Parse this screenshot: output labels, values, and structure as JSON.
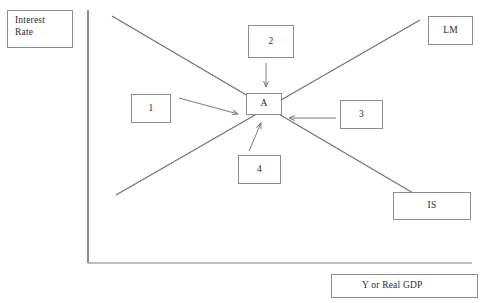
{
  "figure": {
    "type": "is-lm-diagram",
    "background_color": "#ffffff",
    "line_color": "#6e6e6e",
    "box_border_color": "#8c8c8c",
    "text_color": "#2b2b2b"
  },
  "axes": {
    "y_axis": {
      "label": "Interest\nRate",
      "label_line_1": "Interest",
      "label_line_2": "Rate",
      "x": 88,
      "y_top": 10,
      "y_bottom": 263
    },
    "x_axis": {
      "label": "Y or Real GDP",
      "y": 263,
      "x_left": 88,
      "x_right": 472
    }
  },
  "curves": [
    {
      "name": "IS",
      "label": "IS",
      "slope": "downward",
      "x1": 112,
      "y1": 16,
      "x2": 425,
      "y2": 200
    },
    {
      "name": "LM",
      "label": "LM",
      "slope": "upward",
      "x1": 116,
      "y1": 195,
      "x2": 420,
      "y2": 20
    }
  ],
  "equilibrium": {
    "label": "A",
    "x": 263,
    "y": 112
  },
  "callouts": [
    {
      "id": "1",
      "label": "1",
      "points_to": "A",
      "direction": "right-down"
    },
    {
      "id": "2",
      "label": "2",
      "points_to": "A",
      "direction": "down"
    },
    {
      "id": "3",
      "label": "3",
      "points_to": "A",
      "direction": "left"
    },
    {
      "id": "4",
      "label": "4",
      "points_to": "A",
      "direction": "up-right"
    }
  ],
  "labels": {
    "interest_rate_line_1": "Interest",
    "interest_rate_line_2": "Rate",
    "box_1": "1",
    "box_2": "2",
    "box_3": "3",
    "box_4": "4",
    "point_a": "A",
    "lm_curve": "LM",
    "is_curve": "IS",
    "x_axis_title": "Y or Real GDP"
  }
}
